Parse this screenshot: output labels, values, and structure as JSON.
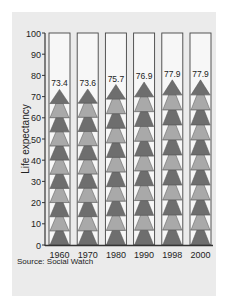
{
  "chart_data": {
    "type": "bar",
    "title": "",
    "xlabel": "",
    "ylabel": "Life expectancy",
    "ylim": [
      0,
      100
    ],
    "yticks": [
      0,
      10,
      20,
      30,
      40,
      50,
      60,
      70,
      80,
      90,
      100
    ],
    "categories": [
      "1960",
      "1970",
      "1980",
      "1990",
      "1998",
      "2000"
    ],
    "values": [
      73.4,
      73.6,
      75.7,
      76.9,
      77.9,
      77.9
    ],
    "value_labels": [
      "73.4",
      "73.6",
      "75.7",
      "76.9",
      "77.9",
      "77.9"
    ],
    "grid": false,
    "legend": null,
    "style": "pictogram stacked triangles in columns bounded at 100",
    "colors": {
      "dark_triangle": "#6e6e6e",
      "light_triangle": "#a9a9a9",
      "column_fill": "#f7f7f7",
      "panel": "#ebebeb",
      "axis": "#333333"
    }
  },
  "source": "Source: Social Watch"
}
